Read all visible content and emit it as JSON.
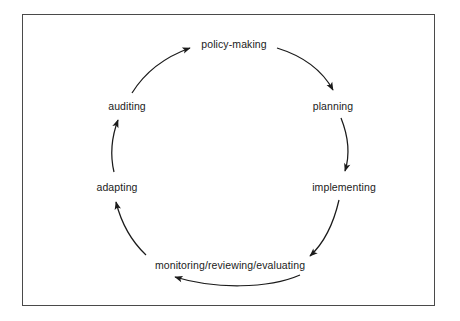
{
  "figure": {
    "border_color": "#4a4a4a",
    "background_color": "#ffffff",
    "line_color": "#1b1b1b",
    "text_color": "#1b1b1b"
  },
  "diagram": {
    "type": "cycle",
    "direction": "clockwise",
    "stage_count": 6,
    "stages": [
      {
        "id": "policy-making",
        "label": "policy-making",
        "x": 234,
        "y": 45
      },
      {
        "id": "planning",
        "label": "planning",
        "x": 333,
        "y": 107
      },
      {
        "id": "implementing",
        "label": "implementing",
        "x": 344,
        "y": 188
      },
      {
        "id": "monitoring-reviewing-evaluating",
        "label": "monitoring/reviewing/evaluating",
        "x": 230,
        "y": 266
      },
      {
        "id": "adapting",
        "label": "adapting",
        "x": 117,
        "y": 188
      },
      {
        "id": "auditing",
        "label": "auditing",
        "x": 127,
        "y": 107
      }
    ],
    "arrows": [
      {
        "id": "arrow-policy-making-to-planning",
        "from": "policy-making",
        "to": "planning"
      },
      {
        "id": "arrow-planning-to-implementing",
        "from": "planning",
        "to": "implementing"
      },
      {
        "id": "arrow-implementing-to-monitoring",
        "from": "implementing",
        "to": "monitoring-reviewing-evaluating"
      },
      {
        "id": "arrow-monitoring-to-adapting",
        "from": "monitoring-reviewing-evaluating",
        "to": "adapting"
      },
      {
        "id": "arrow-adapting-to-auditing",
        "from": "adapting",
        "to": "auditing"
      },
      {
        "id": "arrow-auditing-to-policy-making",
        "from": "auditing",
        "to": "policy-making"
      }
    ]
  }
}
